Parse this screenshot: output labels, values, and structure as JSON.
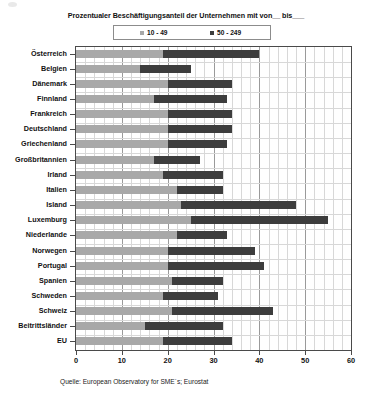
{
  "chart_data": {
    "type": "bar",
    "orientation": "horizontal",
    "stacked": true,
    "title": "Prozentualer Beschäftigungsanteil der Unternehmen mit  von__  bis___",
    "xlabel": "",
    "ylabel": "",
    "xlim": [
      0,
      60
    ],
    "xticks": [
      0,
      10,
      20,
      30,
      40,
      50,
      60
    ],
    "xtick_labels": [
      "0",
      "10",
      "20",
      "30",
      "40",
      "50",
      "60"
    ],
    "grid": true,
    "legend_position": "top",
    "categories": [
      "Österreich",
      "Belgien",
      "Dänemark",
      "Finnland",
      "Frankreich",
      "Deutschland",
      "Griechenland",
      "Großbritannien",
      "Irland",
      "Italien",
      "Island",
      "Luxemburg",
      "Niederlande",
      "Norwegen",
      "Portugal",
      "Spanien",
      "Schweden",
      "Schweiz",
      "Beitrittsländer",
      "EU"
    ],
    "series": [
      {
        "name": "10 - 49",
        "color": "#a8a8a8",
        "values": [
          19,
          14,
          20,
          17,
          20,
          20,
          20,
          17,
          19,
          22,
          23,
          25,
          22,
          20,
          20,
          21,
          19,
          21,
          15,
          19
        ]
      },
      {
        "name": "50 - 249",
        "color": "#3d3d3d",
        "values": [
          21,
          11,
          14,
          16,
          14,
          14,
          13,
          10,
          13,
          10,
          25,
          30,
          11,
          19,
          21,
          11,
          12,
          22,
          17,
          15
        ]
      }
    ],
    "totals": [
      40,
      25,
      34,
      33,
      34,
      34,
      33,
      27,
      32,
      32,
      48,
      55,
      33,
      39,
      41,
      32,
      31,
      43,
      32,
      34
    ],
    "annotations": []
  },
  "legend": {
    "entries": [
      {
        "label": "10 - 49",
        "color": "#a8a8a8",
        "marker": "square-marker"
      },
      {
        "label": "50 - 249",
        "color": "#3d3d3d",
        "marker": "square-marker"
      }
    ]
  },
  "source": {
    "text": "Quelle: European Observatory for SME´s; Eurostat"
  }
}
